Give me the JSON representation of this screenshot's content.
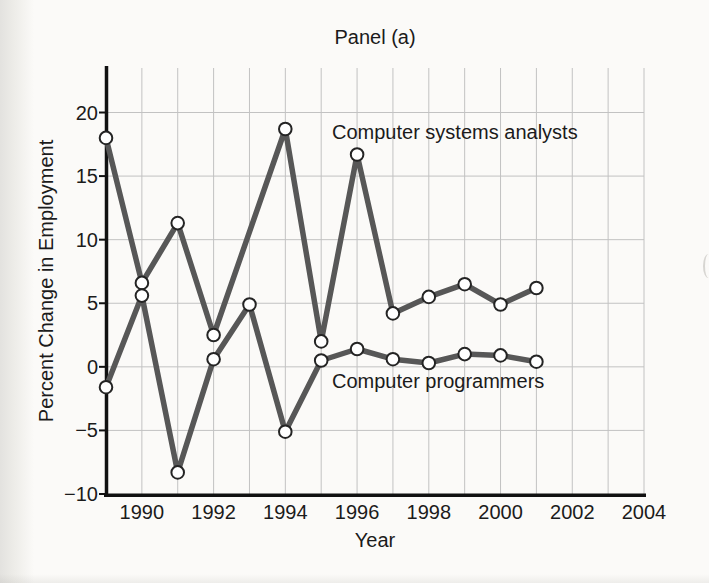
{
  "chart_data": {
    "type": "line",
    "title": "Panel (a)",
    "xlabel": "Year",
    "ylabel": "Percent Change in Employment",
    "xlim": [
      1989,
      2004
    ],
    "ylim": [
      -10,
      23.5
    ],
    "grid": "on",
    "x_gridline_every_years": 1,
    "legend_position": "inline-annotations",
    "years": [
      1989,
      1990,
      1991,
      1992,
      1993,
      1994,
      1995,
      1996,
      1997,
      1998,
      1999,
      2000,
      2001
    ],
    "xticks": [
      1990,
      1992,
      1994,
      1996,
      1998,
      2000,
      2002,
      2004
    ],
    "xtick_labels": [
      "1990",
      "1992",
      "1994",
      "1996",
      "1998",
      "2000",
      "2002",
      "2004"
    ],
    "yticks": [
      20,
      15,
      10,
      5,
      0,
      -5,
      -10
    ],
    "ytick_labels": [
      "20",
      "15",
      "10",
      "5",
      "0",
      "−5",
      "−10"
    ],
    "series": [
      {
        "name": "Computer systems analysts",
        "annotation": "Computer systems analysts",
        "values": [
          18.0,
          6.6,
          11.3,
          2.5,
          null,
          18.7,
          2.0,
          16.7,
          4.2,
          5.5,
          6.5,
          4.9,
          6.2
        ]
      },
      {
        "name": "Computer programmers",
        "annotation": "Computer programmers",
        "values": [
          -1.6,
          5.6,
          -8.3,
          0.6,
          4.9,
          -5.1,
          0.5,
          1.4,
          0.6,
          0.3,
          1.0,
          0.9,
          0.4
        ]
      }
    ],
    "colors": {
      "line": "#575757",
      "marker_fill": "#ffffff",
      "marker_stroke": "#242424",
      "grid": "#c2c2c2",
      "axis": "#111111",
      "text": "#1b1b1b"
    }
  }
}
